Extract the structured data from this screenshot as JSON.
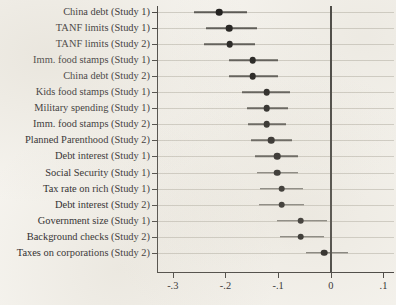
{
  "chart_data": {
    "type": "scatter",
    "subtype": "dot-and-whisker coefficient plot",
    "title": "",
    "subtitle": "",
    "xlabel": "",
    "ylabel": "",
    "xlim": [
      -0.33,
      0.12
    ],
    "xticks": [
      -0.3,
      -0.2,
      -0.1,
      0,
      0.1
    ],
    "xticklabels": [
      "-.3",
      "-.2",
      "-.1",
      "0",
      ".1"
    ],
    "grid": true,
    "grid_axis": "y",
    "legend": null,
    "reference_line": {
      "value": 0,
      "orientation": "vertical",
      "color": "#3a3936"
    },
    "categories": [
      "China debt (Study 1)",
      "TANF limits (Study 1)",
      "TANF limits (Study 2)",
      "Imm. food stamps (Study 1)",
      "China debt (Study 2)",
      "Kids food stamps (Study 1)",
      "Military spending (Study 1)",
      "Imm. food stamps (Study 2)",
      "Planned Parenthood (Study 2)",
      "Debt interest (Study 1)",
      "Social Security (Study 1)",
      "Tax rate on rich (Study 1)",
      "Debt interest (Study 2)",
      "Government size (Study 1)",
      "Background checks (Study 2)",
      "Taxes on corporations (Study 2)"
    ],
    "values": [
      -0.212,
      -0.193,
      -0.192,
      -0.148,
      -0.148,
      -0.122,
      -0.122,
      -0.122,
      -0.113,
      -0.102,
      -0.102,
      -0.093,
      -0.093,
      -0.057,
      -0.057,
      -0.013
    ],
    "ci_low": [
      -0.26,
      -0.237,
      -0.24,
      -0.193,
      -0.193,
      -0.168,
      -0.16,
      -0.157,
      -0.152,
      -0.143,
      -0.14,
      -0.135,
      -0.137,
      -0.102,
      -0.097,
      -0.048
    ],
    "ci_high": [
      -0.16,
      -0.14,
      -0.143,
      -0.1,
      -0.1,
      -0.077,
      -0.082,
      -0.085,
      -0.073,
      -0.063,
      -0.063,
      -0.052,
      -0.05,
      -0.007,
      -0.013,
      0.032
    ],
    "points": [
      {
        "label": "China debt (Study 1)",
        "value": -0.212,
        "ci_low": -0.26,
        "ci_high": -0.16
      },
      {
        "label": "TANF limits (Study 1)",
        "value": -0.193,
        "ci_low": -0.237,
        "ci_high": -0.14
      },
      {
        "label": "TANF limits (Study 2)",
        "value": -0.192,
        "ci_low": -0.24,
        "ci_high": -0.143
      },
      {
        "label": "Imm. food stamps (Study 1)",
        "value": -0.148,
        "ci_low": -0.193,
        "ci_high": -0.1
      },
      {
        "label": "China debt (Study 2)",
        "value": -0.148,
        "ci_low": -0.193,
        "ci_high": -0.1
      },
      {
        "label": "Kids food stamps (Study 1)",
        "value": -0.122,
        "ci_low": -0.168,
        "ci_high": -0.077
      },
      {
        "label": "Military spending (Study 1)",
        "value": -0.122,
        "ci_low": -0.16,
        "ci_high": -0.082
      },
      {
        "label": "Imm. food stamps (Study 2)",
        "value": -0.122,
        "ci_low": -0.157,
        "ci_high": -0.085
      },
      {
        "label": "Planned Parenthood (Study 2)",
        "value": -0.113,
        "ci_low": -0.152,
        "ci_high": -0.073
      },
      {
        "label": "Debt interest (Study 1)",
        "value": -0.102,
        "ci_low": -0.143,
        "ci_high": -0.063
      },
      {
        "label": "Social Security (Study 1)",
        "value": -0.102,
        "ci_low": -0.14,
        "ci_high": -0.063
      },
      {
        "label": "Tax rate on rich (Study 1)",
        "value": -0.093,
        "ci_low": -0.135,
        "ci_high": -0.052
      },
      {
        "label": "Debt interest (Study 2)",
        "value": -0.093,
        "ci_low": -0.137,
        "ci_high": -0.05
      },
      {
        "label": "Government size (Study 1)",
        "value": -0.057,
        "ci_low": -0.102,
        "ci_high": -0.007
      },
      {
        "label": "Background checks (Study 2)",
        "value": -0.057,
        "ci_low": -0.097,
        "ci_high": -0.013
      },
      {
        "label": "Taxes on corporations (Study 2)",
        "value": -0.013,
        "ci_low": -0.048,
        "ci_high": 0.032
      }
    ],
    "colors": {
      "dot": "#151413",
      "whisker": "#53514d",
      "grid": "#cfccc4",
      "axis": "#3d3b38",
      "background": "#f6f4ef",
      "text": "#23211e"
    }
  }
}
